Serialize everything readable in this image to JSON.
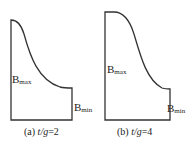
{
  "figure": {
    "panels": [
      {
        "id": "a",
        "caption_prefix": "(a) ",
        "caption_var": "t/g",
        "caption_value": "=2",
        "label_max": {
          "base": "B",
          "sub": "max"
        },
        "label_min": {
          "base": "B",
          "sub": "min"
        }
      },
      {
        "id": "b",
        "caption_prefix": "(b) ",
        "caption_var": "t/g",
        "caption_value": "=4",
        "label_max": {
          "base": "B",
          "sub": "max"
        },
        "label_min": {
          "base": "B",
          "sub": "min"
        }
      }
    ],
    "stroke_color": "#333333"
  }
}
